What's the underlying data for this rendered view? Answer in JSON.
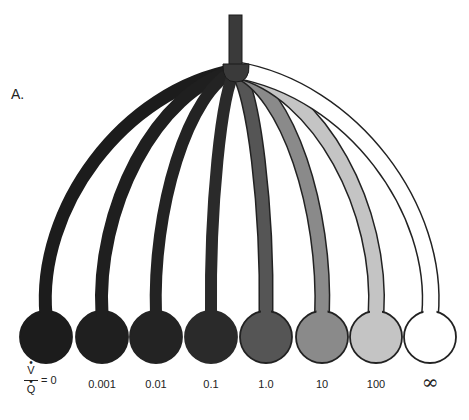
{
  "figure": {
    "panel_label": "A.",
    "hub": {
      "x": 236,
      "y": 70,
      "color": "#3a3a3a"
    },
    "stem": {
      "x": 229,
      "y": 15,
      "width": 13,
      "height": 55,
      "color": "#3a3a3a"
    },
    "ratio_axis": {
      "numerator": "V",
      "denominator": "Q",
      "equals_first": "= 0"
    },
    "units": [
      {
        "label": "0",
        "cx": 46,
        "fill": "#1c1c1c",
        "stroke": "#1c1c1c",
        "branch_width": 13
      },
      {
        "label": "0.001",
        "cx": 102,
        "fill": "#1f1f1f",
        "stroke": "#1f1f1f",
        "branch_width": 13
      },
      {
        "label": "0.01",
        "cx": 156,
        "fill": "#232323",
        "stroke": "#232323",
        "branch_width": 12
      },
      {
        "label": "0.1",
        "cx": 211,
        "fill": "#2a2a2a",
        "stroke": "#2a2a2a",
        "branch_width": 12
      },
      {
        "label": "1.0",
        "cx": 266,
        "fill": "#555555",
        "stroke": "#222222",
        "branch_width": 12
      },
      {
        "label": "10",
        "cx": 322,
        "fill": "#8a8a8a",
        "stroke": "#222222",
        "branch_width": 13
      },
      {
        "label": "100",
        "cx": 376,
        "fill": "#c4c4c4",
        "stroke": "#222222",
        "branch_width": 14
      },
      {
        "label": "∞",
        "cx": 430,
        "fill": "#ffffff",
        "stroke": "#222222",
        "branch_width": 15
      }
    ],
    "circle_cy": 337,
    "circle_r": 26
  }
}
